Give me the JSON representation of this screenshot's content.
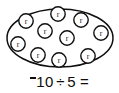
{
  "figure": {
    "kind": "set-model-division-diagram",
    "stroke_color": "#101010",
    "fill_color": "#ffffff",
    "background_color": "#ffffff"
  },
  "group": {
    "container_name": "oval-group-boundary",
    "ellipse": {
      "cx": 60,
      "cy": 38,
      "rx": 54,
      "ry": 30
    },
    "counter_count": 10,
    "counter_radius": 7.2,
    "counters": [
      {
        "label": "r",
        "cx": 26,
        "cy": 21
      },
      {
        "label": "r",
        "cx": 58,
        "cy": 14
      },
      {
        "label": "r",
        "cx": 81,
        "cy": 20
      },
      {
        "label": "r",
        "cx": 45,
        "cy": 31
      },
      {
        "label": "r",
        "cx": 67,
        "cy": 38
      },
      {
        "label": "r",
        "cx": 101,
        "cy": 33
      },
      {
        "label": "r",
        "cx": 18,
        "cy": 44
      },
      {
        "label": "r",
        "cx": 38,
        "cy": 55
      },
      {
        "label": "r",
        "cx": 59,
        "cy": 60
      },
      {
        "label": "r",
        "cx": 88,
        "cy": 56
      }
    ]
  },
  "equation": {
    "negative_sign": "¯",
    "dividend": "10",
    "operator": "÷",
    "divisor": "5",
    "equals": "=",
    "answer_blank": "",
    "full_text": "¯10 ÷ 5 ="
  }
}
